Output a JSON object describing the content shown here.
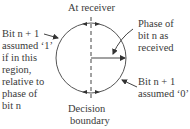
{
  "diagram": {
    "title_top": "At receiver",
    "title_bottom": [
      "Decision",
      "boundary"
    ],
    "left_label": [
      "Bit n + 1",
      "assumed ‘1’",
      "if in this",
      "region,",
      "relative to",
      "phase of",
      "bit n"
    ],
    "right_top_label": [
      "Phase of",
      "bit n as",
      "received"
    ],
    "right_bottom_label": [
      "Bit n + 1",
      "assumed ‘0’"
    ],
    "colors": {
      "stroke": "#444444",
      "text": "#3a3a3a"
    }
  }
}
